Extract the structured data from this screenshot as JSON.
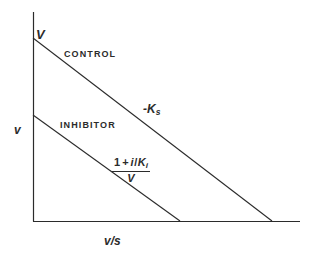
{
  "figure": {
    "kind": "eadie-hofstee-plot",
    "background_color": "#ffffff",
    "line_color": "#2b2b2b"
  },
  "axes": {
    "y_label": "v",
    "x_label": "v/s",
    "y_intercept_label": "V",
    "x_origin_px": 33,
    "y_origin_px": 221,
    "y_top_px": 12,
    "x_right_px": 300,
    "ticks": [],
    "grid": false
  },
  "labels": {
    "control": "CONTROL",
    "inhibitor": "INHIBITOR",
    "slope_control_prefix": "-K",
    "slope_control_subscript": "s",
    "slope_inhibitor_numer_one": "1",
    "slope_inhibitor_numer_plus": "+",
    "slope_inhibitor_numer_i": "i",
    "slope_inhibitor_numer_slash": "/",
    "slope_inhibitor_numer_K": "K",
    "slope_inhibitor_numer_K_sub": "i",
    "slope_inhibitor_denom": "V"
  },
  "chart_data": {
    "type": "line",
    "title": "",
    "xlabel": "v/s",
    "ylabel": "v",
    "grid": false,
    "legend": "inline-annotations",
    "xlim": [
      0,
      1
    ],
    "ylim": [
      0,
      1
    ],
    "annotations": [
      {
        "text": "V",
        "meaning": "y-intercept of control line (Vmax)",
        "x_px": 36,
        "y_px": 28
      },
      {
        "text": "CONTROL",
        "meaning": "uncompetitive/control line label",
        "x_px": 64,
        "y_px": 50
      },
      {
        "text": "INHIBITOR",
        "meaning": "inhibited line label",
        "x_px": 60,
        "y_px": 121
      },
      {
        "text": "-Ks",
        "meaning": "slope of control line",
        "x_px": 143,
        "y_px": 103
      },
      {
        "text": "(1 + i/Ki)/V",
        "meaning": "slope magnitude of inhibitor line",
        "x_px": 112,
        "y_px": 157
      }
    ],
    "series": [
      {
        "name": "CONTROL",
        "slope_label": "-Ks",
        "y_intercept_label": "V",
        "points_px": [
          [
            33,
            38
          ],
          [
            272,
            221
          ]
        ],
        "points_data": [
          [
            0.0,
            1.0
          ],
          [
            1.0,
            0.0
          ]
        ]
      },
      {
        "name": "INHIBITOR",
        "slope_label": "(1 + i/Ki)/V",
        "y_intercept_label": "",
        "points_px": [
          [
            33,
            115
          ],
          [
            180,
            221
          ]
        ],
        "points_data": [
          [
            0.0,
            0.585
          ],
          [
            0.615,
            0.0
          ]
        ]
      }
    ]
  }
}
